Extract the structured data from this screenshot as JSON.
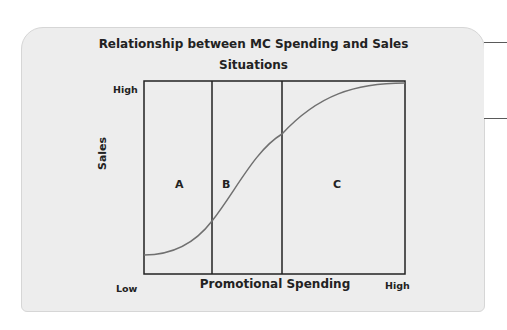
{
  "diagram": {
    "title_line1": "Relationship between MC Spending and Sales",
    "title_line2": "Situations",
    "x_axis_label": "Promotional Spending",
    "y_axis_label": "Sales",
    "y_high_label": "High",
    "x_low_label": "Low",
    "x_high_label": "High",
    "regions": [
      {
        "label": "A"
      },
      {
        "label": "B"
      },
      {
        "label": "C"
      }
    ],
    "curve_shape": "s-curve",
    "colors": {
      "card_bg": "#ededed",
      "line": "#222222",
      "curve": "#707070"
    }
  }
}
